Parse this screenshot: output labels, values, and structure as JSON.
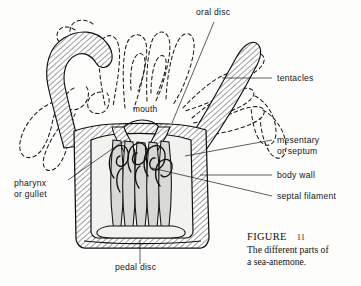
{
  "figure": {
    "domain": "scientific-illustration",
    "background_color": "#fdfdfb",
    "ink_color": "#101010"
  },
  "labels": [
    {
      "id": "oral-disc",
      "text": "oral disc",
      "x": 196,
      "y": 15,
      "anchor": "start",
      "lines": [
        "oral disc"
      ]
    },
    {
      "id": "tentacles",
      "text": "tentacles",
      "x": 277,
      "y": 81,
      "anchor": "start",
      "lines": [
        "tentacles"
      ]
    },
    {
      "id": "mouth",
      "text": "mouth",
      "x": 133,
      "y": 112,
      "anchor": "start",
      "lines": [
        "mouth"
      ]
    },
    {
      "id": "mesentery",
      "text": "mesentary or septum",
      "x": 277,
      "y": 143,
      "anchor": "start",
      "lines": [
        "mesentary",
        "or septum"
      ]
    },
    {
      "id": "body-wall",
      "text": "body wall",
      "x": 277,
      "y": 178,
      "anchor": "start",
      "lines": [
        "body wall"
      ]
    },
    {
      "id": "septal-filament",
      "text": "septal filament",
      "x": 277,
      "y": 199,
      "anchor": "start",
      "lines": [
        "septal filament"
      ]
    },
    {
      "id": "pharynx",
      "text": "pharynx or gullet",
      "x": 14,
      "y": 186,
      "anchor": "start",
      "lines": [
        "pharynx",
        "or gullet"
      ]
    },
    {
      "id": "pedal-disc",
      "text": "pedal disc",
      "x": 115,
      "y": 269,
      "anchor": "start",
      "lines": [
        "pedal disc"
      ]
    }
  ],
  "caption": {
    "figure_word": "FIGURE",
    "figure_number": "11",
    "line1": "The different parts of",
    "line2": "a sea-anemone.",
    "x": 247,
    "y": 239
  },
  "leaders": [
    {
      "id": "leader-oral-disc",
      "points": "214,22 172,123"
    },
    {
      "id": "leader-tentacles",
      "points": "272,78 222,78"
    },
    {
      "id": "leader-mesentery",
      "points": "272,140 185,156"
    },
    {
      "id": "leader-body-wall",
      "points": "272,175 200,175"
    },
    {
      "id": "leader-septal-filament",
      "points": "272,196 152,168"
    },
    {
      "id": "leader-pharynx",
      "points": "68,180 125,140"
    },
    {
      "id": "leader-pedal-disc",
      "points": "140,264 140,240"
    }
  ]
}
